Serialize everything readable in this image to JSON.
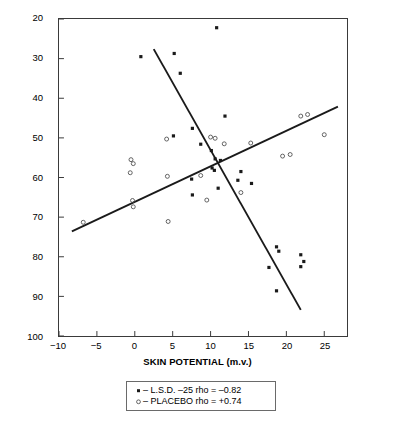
{
  "chart_data": {
    "type": "scatter",
    "title": "",
    "xlabel": "SKIN POTENTIAL (m.v.)",
    "ylabel": "TWO-FLASH THRESHOLD (m.secs)",
    "xlim": [
      -10,
      28
    ],
    "ylim": [
      20,
      100
    ],
    "y_inverted": true,
    "grid": false,
    "xticks": [
      -10,
      -5,
      0,
      5,
      10,
      15,
      20,
      25
    ],
    "xtick_labels": [
      "−10",
      "−5",
      "0",
      "5",
      "10",
      "15",
      "20",
      "25"
    ],
    "yticks": [
      20,
      30,
      40,
      50,
      60,
      70,
      80,
      90,
      100
    ],
    "ytick_labels": [
      "20",
      "30",
      "40",
      "50",
      "60",
      "70",
      "80",
      "90",
      "100"
    ],
    "legend_position": "below-axes",
    "series": [
      {
        "name": "L.S.D. −25",
        "marker": "filled-square",
        "color": "#1a1a1a",
        "rho": "−0.82",
        "points": [
          [
            10.8,
            22.2
          ],
          [
            0.8,
            29.5
          ],
          [
            5.2,
            28.7
          ],
          [
            6.0,
            33.7
          ],
          [
            11.9,
            44.5
          ],
          [
            7.6,
            47.6
          ],
          [
            5.1,
            49.5
          ],
          [
            8.7,
            51.6
          ],
          [
            10.1,
            53.2
          ],
          [
            10.6,
            55.3
          ],
          [
            11.3,
            55.7
          ],
          [
            10.2,
            57.6
          ],
          [
            10.5,
            58.2
          ],
          [
            14.0,
            58.5
          ],
          [
            7.5,
            60.4
          ],
          [
            13.6,
            60.7
          ],
          [
            15.4,
            61.5
          ],
          [
            11.0,
            62.7
          ],
          [
            7.6,
            64.4
          ],
          [
            19.0,
            78.6
          ],
          [
            18.7,
            77.5
          ],
          [
            21.9,
            79.5
          ],
          [
            22.3,
            81.2
          ],
          [
            21.9,
            82.5
          ],
          [
            17.7,
            82.7
          ],
          [
            18.7,
            88.6
          ]
        ]
      },
      {
        "name": "PLACEBO",
        "marker": "open-circle",
        "color": "#4a4a4a",
        "rho": "+0.74",
        "points": [
          [
            -6.8,
            71.3
          ],
          [
            -0.5,
            55.5
          ],
          [
            -0.2,
            56.5
          ],
          [
            -0.6,
            58.8
          ],
          [
            -0.3,
            65.8
          ],
          [
            -0.2,
            67.4
          ],
          [
            4.2,
            50.3
          ],
          [
            4.3,
            59.7
          ],
          [
            4.4,
            71.1
          ],
          [
            8.7,
            59.5
          ],
          [
            9.5,
            65.7
          ],
          [
            10.0,
            49.8
          ],
          [
            10.6,
            50.1
          ],
          [
            11.8,
            51.5
          ],
          [
            14.0,
            63.8
          ],
          [
            15.3,
            51.3
          ],
          [
            19.5,
            54.6
          ],
          [
            20.5,
            54.2
          ],
          [
            21.9,
            44.5
          ],
          [
            22.8,
            44.1
          ],
          [
            25.0,
            49.2
          ]
        ]
      }
    ],
    "trend_lines": [
      {
        "name": "L.S.D. −25 regression line",
        "x1": 2.5,
        "y1": 27.6,
        "x2": 21.9,
        "y2": 93.4
      },
      {
        "name": "PLACEBO regression line",
        "x1": -8.3,
        "y1": 73.6,
        "x2": 26.8,
        "y2": 42.1
      }
    ]
  },
  "legend": {
    "rows": [
      {
        "marker": "filled-square-marker",
        "text": "– L.S.D. –25   rho = –0.82"
      },
      {
        "marker": "open-circle-marker",
        "text": "– PLACEBO   rho = +0.74"
      }
    ]
  },
  "axes": {
    "x_label": "SKIN POTENTIAL (m.v.)",
    "y_label": "TWO-FLASH THRESHOLD (m.secs)"
  },
  "colors": {
    "frame": "#3a3a3a",
    "line": "#1a1a1a",
    "marker_filled": "#1a1a1a",
    "marker_open": "#4a4a4a",
    "background": "#ffffff"
  }
}
